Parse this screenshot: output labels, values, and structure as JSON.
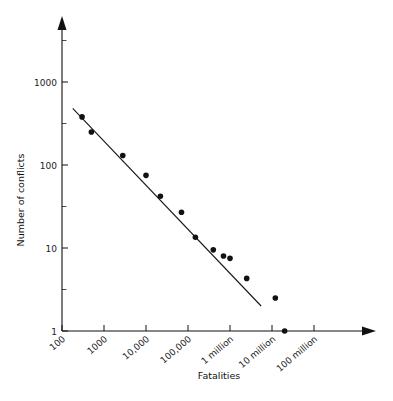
{
  "chart_data": {
    "type": "scatter",
    "title": "",
    "xlabel": "Fatalities",
    "ylabel": "Number of conflicts",
    "xscale": "log",
    "yscale": "log",
    "xlim": [
      100,
      300000000
    ],
    "ylim": [
      1,
      3000
    ],
    "grid": false,
    "legend": null,
    "xticklabels": [
      "100",
      "1000",
      "10,000",
      "100,000",
      "1 million",
      "10 million",
      "100 million"
    ],
    "xtickvalues": [
      100,
      1000,
      10000,
      100000,
      1000000,
      10000000,
      100000000
    ],
    "yticklabels": [
      "1",
      "10",
      "100",
      "1000"
    ],
    "ytickvalues": [
      1,
      10,
      100,
      1000
    ],
    "x": [
      300,
      500,
      2800,
      10000,
      22000,
      70000,
      150000,
      400000,
      700000,
      1000000,
      2500000,
      12000000,
      20000000
    ],
    "y": [
      380,
      250,
      130,
      75,
      42,
      27,
      13.5,
      9.5,
      8,
      7.5,
      4.3,
      2.5,
      1
    ],
    "series": [
      {
        "name": "conflicts",
        "points": [
          {
            "x": 300,
            "y": 380
          },
          {
            "x": 500,
            "y": 250
          },
          {
            "x": 2800,
            "y": 130
          },
          {
            "x": 10000,
            "y": 75
          },
          {
            "x": 22000,
            "y": 42
          },
          {
            "x": 70000,
            "y": 27
          },
          {
            "x": 150000,
            "y": 13.5
          },
          {
            "x": 400000,
            "y": 9.5
          },
          {
            "x": 700000,
            "y": 8
          },
          {
            "x": 1000000,
            "y": 7.5
          },
          {
            "x": 2500000,
            "y": 4.3
          },
          {
            "x": 12000000,
            "y": 2.5
          },
          {
            "x": 20000000,
            "y": 1
          }
        ]
      }
    ],
    "fit_line": {
      "name": "power-law fit",
      "x_start": 180,
      "y_start": 480,
      "x_end": 5500000,
      "y_end": 2.0
    },
    "marker": {
      "shape": "circle",
      "radius_px": 2.8,
      "color": "#111111"
    },
    "line_color": "#1a1a1a",
    "axis_color": "#111111",
    "background": "#ffffff"
  }
}
